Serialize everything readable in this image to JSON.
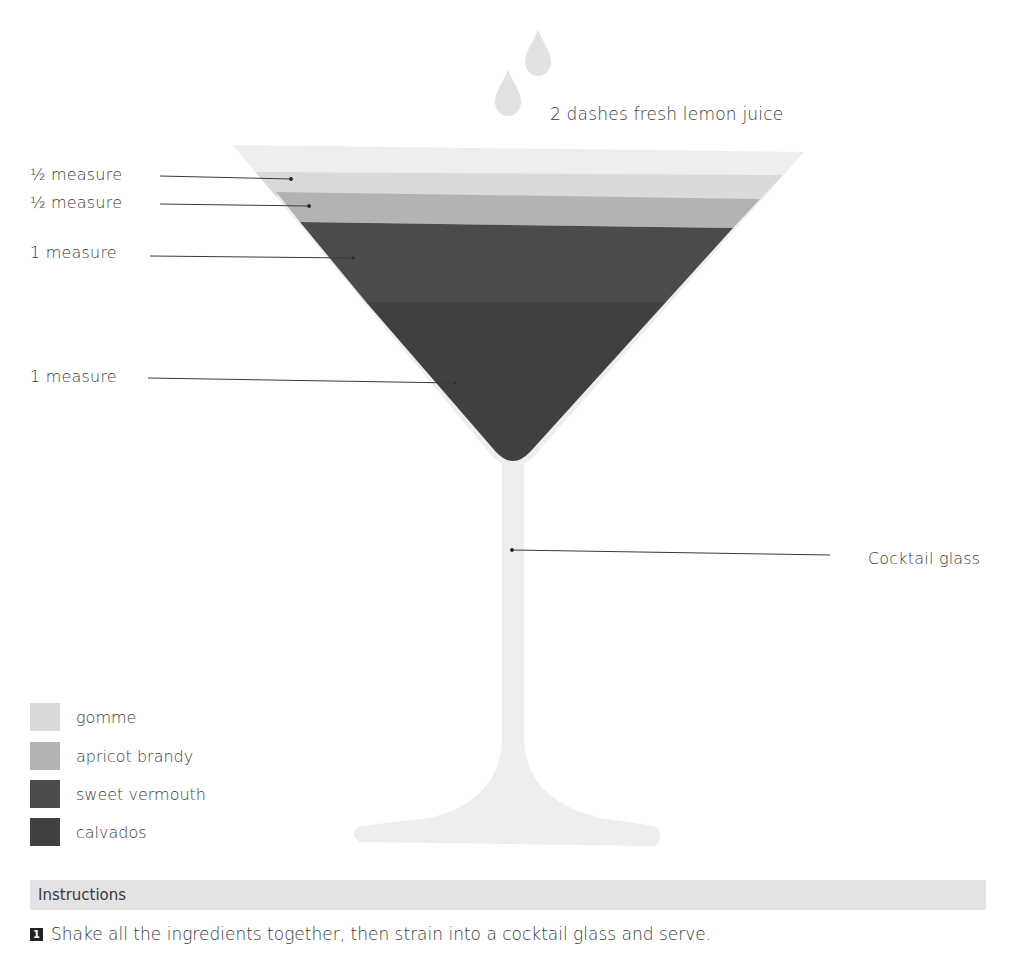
{
  "garnish": {
    "label": "2 dashes fresh lemon juice",
    "icon": "droplet-icon"
  },
  "glass": {
    "label": "Cocktail glass",
    "rim_color": "#ededed",
    "stem_color": "#eeeeee"
  },
  "layers": [
    {
      "ingredient": "gomme",
      "measure": "½ measure",
      "color": "#dadada"
    },
    {
      "ingredient": "apricot brandy",
      "measure": "½ measure",
      "color": "#b3b3b3"
    },
    {
      "ingredient": "sweet vermouth",
      "measure": "1 measure",
      "color": "#4b4b4b"
    },
    {
      "ingredient": "calvados",
      "measure": "1 measure",
      "color": "#404040"
    }
  ],
  "legend": [
    {
      "label": "gomme",
      "color": "#dadada"
    },
    {
      "label": "apricot brandy",
      "color": "#b3b3b3"
    },
    {
      "label": "sweet vermouth",
      "color": "#4b4b4b"
    },
    {
      "label": "calvados",
      "color": "#404040"
    }
  ],
  "instructions": {
    "title": "Instructions",
    "steps": [
      {
        "number": "1",
        "text": "Shake all the ingredients together, then strain into a cocktail glass and serve."
      }
    ]
  }
}
